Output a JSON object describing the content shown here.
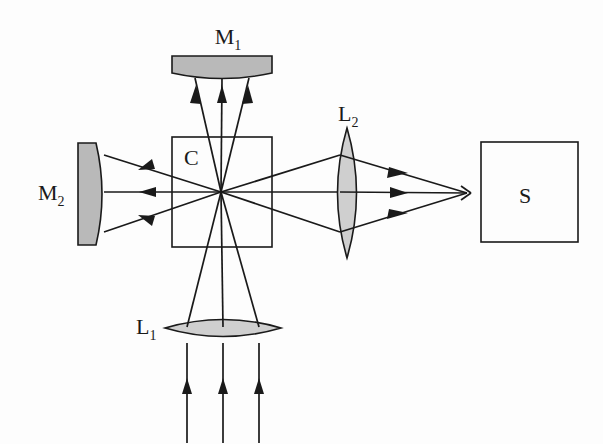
{
  "figure": {
    "background_color": "#fdfdfd",
    "ink_color": "#1a1a1a",
    "glass_fill_color": "#cfcfcf",
    "mirror_fill_color": "#b9b9b9"
  },
  "labels": {
    "mirror_top": {
      "base": "M",
      "subscript": "1",
      "x": 228,
      "y": 44
    },
    "mirror_left": {
      "base": "M",
      "subscript": "2",
      "x": 38,
      "y": 200
    },
    "lens_bottom": {
      "base": "L",
      "subscript": "1",
      "x": 136,
      "y": 334
    },
    "lens_right": {
      "base": "L",
      "subscript": "2",
      "x": 338,
      "y": 121
    },
    "cube": {
      "base": "C",
      "subscript": "",
      "x": 184,
      "y": 165
    },
    "screen": {
      "base": "S",
      "subscript": "",
      "x": 519,
      "y": 203
    }
  },
  "components": [
    {
      "name": "mirror-m1",
      "type": "concave-mirror",
      "orientation": "horizontal-top",
      "label": "M1",
      "bounds": {
        "x": 172,
        "y": 56,
        "width": 100,
        "height": 22
      }
    },
    {
      "name": "mirror-m2",
      "type": "concave-mirror",
      "orientation": "vertical-left",
      "label": "M2",
      "bounds": {
        "x": 78,
        "y": 143,
        "width": 28,
        "height": 102
      }
    },
    {
      "name": "beam-splitter-cube",
      "type": "square-box",
      "label": "C",
      "bounds": {
        "x": 172,
        "y": 137,
        "width": 100,
        "height": 110
      }
    },
    {
      "name": "lens-l1",
      "type": "biconvex-lens",
      "orientation": "horizontal",
      "label": "L1",
      "bounds": {
        "x": 165,
        "y": 313,
        "width": 116,
        "height": 30
      }
    },
    {
      "name": "lens-l2",
      "type": "biconvex-lens",
      "orientation": "vertical",
      "label": "L2",
      "bounds": {
        "x": 328,
        "y": 128,
        "width": 38,
        "height": 130
      }
    },
    {
      "name": "screen-s",
      "type": "square-box",
      "label": "S",
      "bounds": {
        "x": 481,
        "y": 142,
        "width": 97,
        "height": 100
      }
    }
  ],
  "optics": {
    "crossing_point": {
      "x": 221,
      "y": 192
    },
    "focus_point_right": {
      "x": 465,
      "y": 193
    },
    "ray_count_per_bundle": 3,
    "bundles": [
      {
        "name": "input-bundle-bottom",
        "direction": "upward",
        "arrow": "up"
      },
      {
        "name": "bundle-to-m1",
        "direction": "upward",
        "arrow": "up"
      },
      {
        "name": "bundle-to-m2",
        "direction": "leftward",
        "arrow": "left"
      },
      {
        "name": "bundle-to-s",
        "direction": "rightward",
        "arrow": "right"
      }
    ]
  }
}
